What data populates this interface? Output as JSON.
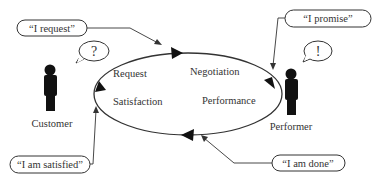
{
  "diagram": {
    "title": "",
    "actors": {
      "customer": {
        "label": "Customer",
        "thought": "?"
      },
      "performer": {
        "label": "Performer",
        "thought": "!"
      }
    },
    "phases": {
      "request": "Request",
      "negotiation": "Negotiation",
      "performance": "Performance",
      "satisfaction": "Satisfaction"
    },
    "speech_acts": {
      "request": "“I request”",
      "promise": "“I promise”",
      "done": "“I am done”",
      "satisfied": "“I am satisfied”"
    },
    "colors": {
      "line": "#333333",
      "figure": "#111111",
      "background": "#ffffff"
    }
  }
}
